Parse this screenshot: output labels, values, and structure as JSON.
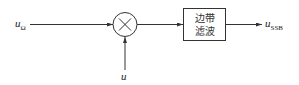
{
  "diagram": {
    "input_signal": {
      "symbol": "u",
      "subscript": "Ω"
    },
    "carrier_signal": {
      "symbol": "u",
      "subscript": ""
    },
    "multiplier": {
      "glyph": "×",
      "icon": "multiplier-icon"
    },
    "filter_block": {
      "line1": "边带",
      "line2": "滤波"
    },
    "output_signal": {
      "symbol": "u",
      "subscript": "SSB"
    }
  }
}
